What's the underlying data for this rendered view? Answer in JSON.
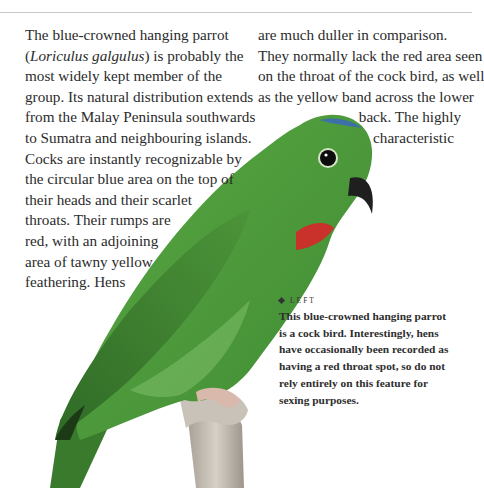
{
  "page": {
    "rule": true,
    "body_text": {
      "left_column": [
        "The blue-crowned hanging parrot",
        {
          "italic": "Loriculus galgulus",
          "before": "(",
          "after": ") is probably the"
        },
        "most widely kept member of the",
        "group. Its natural distribution extends",
        "from the Malay Peninsula southwards",
        "to Sumatra and neighbouring islands.",
        "Cocks are instantly recognizable by",
        "the circular blue area on the top of",
        "their heads and their scarlet",
        "throats. Their rumps are",
        "red, with an adjoining",
        "area of tawny yellow",
        "feathering. Hens"
      ],
      "l1_open": "(",
      "l1_italic": "Loriculus galgulus",
      "l1_rest": ") is probably the",
      "right_column": [
        "are much duller in comparison.",
        "They normally lack the red area seen",
        "on the throat of the cock bird, as well",
        "as the yellow band across the lower",
        "back. The highly",
        "characteristic"
      ]
    },
    "caption": {
      "tag": "LEFT",
      "lines": [
        "This blue-crowned hanging parrot",
        "is a cock bird. Interestingly, hens",
        "have occasionally been recorded as",
        "having a red throat spot, so do not",
        "rely entirely on this feature for",
        "sexing purposes."
      ]
    },
    "image": {
      "subject": "blue-crowned hanging parrot perched on branch",
      "colors": {
        "body": "#4f9a3c",
        "wing": "#3f7f30",
        "crown": "#3d6fa8",
        "throat": "#c8322a",
        "beak": "#1f1f1f",
        "perch": "#bfb8ae"
      }
    }
  }
}
